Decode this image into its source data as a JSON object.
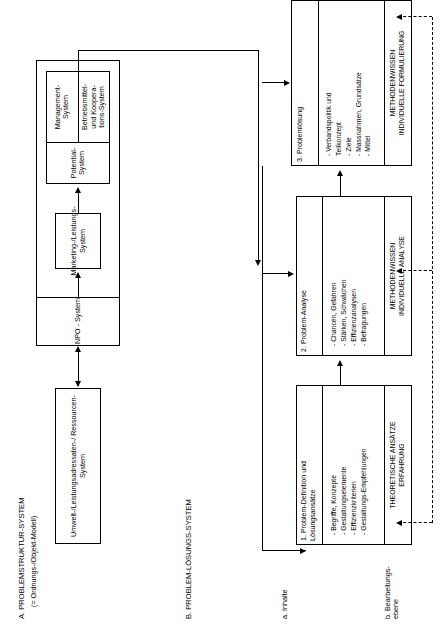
{
  "diagram": {
    "sections": {
      "a": {
        "id": "A.",
        "title": "A. PROBLEMSTRUKTUR-SYSTEM",
        "subtitle": "(= Ordnungs-/Objekt-Modell)"
      },
      "b": {
        "id": "B.",
        "title": "B. PROBLEM-LÖSUNGS-SYSTEM"
      }
    },
    "row_labels": [
      {
        "key": "a",
        "text": "a. Inhalte"
      },
      {
        "key": "b",
        "text": "b. Bearbeitungs-\nebene"
      }
    ],
    "structure_boxes": {
      "environment": "Umwelt-/Leistungsadressaten-/\nRessourcen-System",
      "npo": "NPO - System",
      "marketing": "Marketing-/Leistungs-\nSystem",
      "potential": "Potential-System",
      "management": "Management-\nSystem",
      "operations": "Betriebsmittel-\nund Koopera-\ntions-System"
    },
    "process_boxes": [
      {
        "key": "step1",
        "title": "1. Problem-Definition und\n    Lösungsansätze",
        "bullets": "- Begriffe, Konzepte\n- Gestaltungselemente\n- Effizienzkriterien\n- Gestaltungs-Empfehlungen",
        "footer": "THEORETISCHE ANSÄTZE\nERFAHRUNG"
      },
      {
        "key": "step2",
        "title": "2. Problem-Analyse",
        "bullets": "- Chancen, Gefahren\n- Stärken, Schwächen\n- Effizienzanalysen\n- Befragungen",
        "footer": "METHODENWISSEN\nINDIVIDUELLE ANALYSE"
      },
      {
        "key": "step3",
        "title": "3. Problemlösung",
        "bullets": "- Verbandspolitik und\n   Teilkonzept\n- Ziele\n- Massnahmen, Grundsätze\n- Mittel",
        "footer": "METHODENWISSEN\nINDIVIDUELLE FORMULIERUNG"
      }
    ],
    "colors": {
      "stroke": "#000000",
      "background": "#ffffff"
    }
  }
}
